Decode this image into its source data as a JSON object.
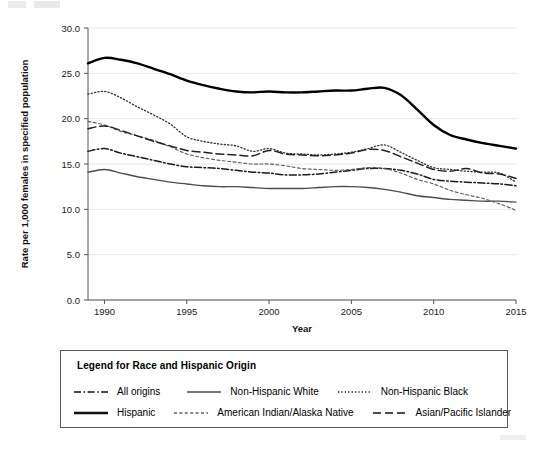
{
  "chart_data": {
    "type": "line",
    "title": "",
    "xlabel": "Year",
    "ylabel": "Rate per 1,000 females in specified population",
    "xlim": [
      1989,
      2015
    ],
    "ylim": [
      0.0,
      30.0
    ],
    "yticks": [
      "0.0",
      "5.0",
      "10.0",
      "15.0",
      "20.0",
      "25.0",
      "30.0"
    ],
    "ytick_values": [
      0,
      5,
      10,
      15,
      20,
      25,
      30
    ],
    "xticks": [
      "1990",
      "1995",
      "2000",
      "2005",
      "2010",
      "2015"
    ],
    "xtick_values": [
      1990,
      1995,
      2000,
      2005,
      2010,
      2015
    ],
    "grid": "horizontal",
    "legend_position": "below-plot",
    "x": [
      1989,
      1990,
      1991,
      1992,
      1993,
      1994,
      1995,
      1996,
      1997,
      1998,
      1999,
      2000,
      2001,
      2002,
      2003,
      2004,
      2005,
      2006,
      2007,
      2008,
      2009,
      2010,
      2011,
      2012,
      2013,
      2014,
      2015
    ],
    "series": [
      {
        "name": "All origins",
        "style": "dash-dot",
        "color": "#1a1a1a",
        "values": [
          16.4,
          16.7,
          16.2,
          15.8,
          15.4,
          15.0,
          14.7,
          14.6,
          14.5,
          14.3,
          14.1,
          14.0,
          13.8,
          13.8,
          13.9,
          14.1,
          14.3,
          14.5,
          14.5,
          14.3,
          13.9,
          13.3,
          13.1,
          13.0,
          12.9,
          12.8,
          12.6
        ],
        "endpoint_visual": 12.8
      },
      {
        "name": "Non-Hispanic White",
        "style": "solid-thin",
        "color": "#4d4d4d",
        "values": [
          14.1,
          14.4,
          14.0,
          13.6,
          13.3,
          13.0,
          12.8,
          12.6,
          12.5,
          12.5,
          12.4,
          12.3,
          12.3,
          12.3,
          12.4,
          12.5,
          12.5,
          12.4,
          12.2,
          11.9,
          11.5,
          11.3,
          11.1,
          11.0,
          10.9,
          10.9,
          10.8
        ],
        "endpoint_visual": 11.0
      },
      {
        "name": "Non-Hispanic Black",
        "style": "dotted",
        "color": "#333333",
        "values": [
          22.7,
          23.0,
          22.3,
          21.3,
          20.4,
          19.4,
          18.0,
          17.5,
          17.2,
          17.0,
          16.4,
          16.7,
          16.2,
          16.1,
          16.0,
          16.1,
          16.3,
          16.7,
          17.1,
          16.3,
          15.4,
          14.6,
          14.4,
          14.2,
          14.1,
          14.0,
          13.0
        ],
        "endpoint_visual": 13.4
      },
      {
        "name": "Hispanic",
        "style": "solid-thick",
        "color": "#000000",
        "values": [
          26.1,
          26.7,
          26.5,
          26.1,
          25.5,
          24.9,
          24.2,
          23.7,
          23.3,
          23.0,
          22.9,
          23.0,
          22.9,
          22.9,
          23.0,
          23.1,
          23.1,
          23.3,
          23.4,
          22.6,
          21.0,
          19.3,
          18.2,
          17.7,
          17.3,
          17.0,
          16.7
        ],
        "endpoint_visual": 16.7
      },
      {
        "name": "American Indian/Alaska Native",
        "style": "fine-dash",
        "color": "#5a5a5a",
        "values": [
          19.7,
          19.3,
          18.6,
          18.1,
          17.6,
          16.9,
          16.1,
          15.7,
          15.4,
          15.2,
          15.0,
          15.0,
          14.8,
          14.5,
          14.4,
          14.3,
          14.4,
          14.6,
          14.5,
          14.0,
          13.3,
          12.8,
          12.1,
          11.6,
          11.2,
          10.6,
          9.9
        ],
        "endpoint_visual": 10.0
      },
      {
        "name": "Asian/Pacific Islander",
        "style": "long-dash",
        "color": "#222222",
        "values": [
          18.9,
          19.2,
          18.7,
          18.1,
          17.5,
          17.0,
          16.5,
          16.3,
          16.1,
          16.0,
          15.9,
          16.5,
          16.1,
          16.0,
          15.9,
          16.0,
          16.2,
          16.6,
          16.5,
          15.8,
          15.1,
          14.4,
          14.2,
          14.5,
          14.0,
          13.9,
          13.4
        ],
        "endpoint_visual": 13.4
      }
    ]
  },
  "legend": {
    "title": "Legend for Race and Hispanic Origin",
    "rows": [
      [
        {
          "label": "All origins",
          "style": "dash-dot"
        },
        {
          "label": "Non-Hispanic White",
          "style": "solid-thin"
        },
        {
          "label": "Non-Hispanic Black",
          "style": "dotted"
        }
      ],
      [
        {
          "label": "Hispanic",
          "style": "solid-thick"
        },
        {
          "label": "American Indian/Alaska Native",
          "style": "fine-dash"
        },
        {
          "label": "Asian/Pacific Islander",
          "style": "long-dash"
        }
      ]
    ]
  },
  "axes": {
    "x_title": "Year",
    "y_title": "Rate per 1,000 females in specified population"
  }
}
